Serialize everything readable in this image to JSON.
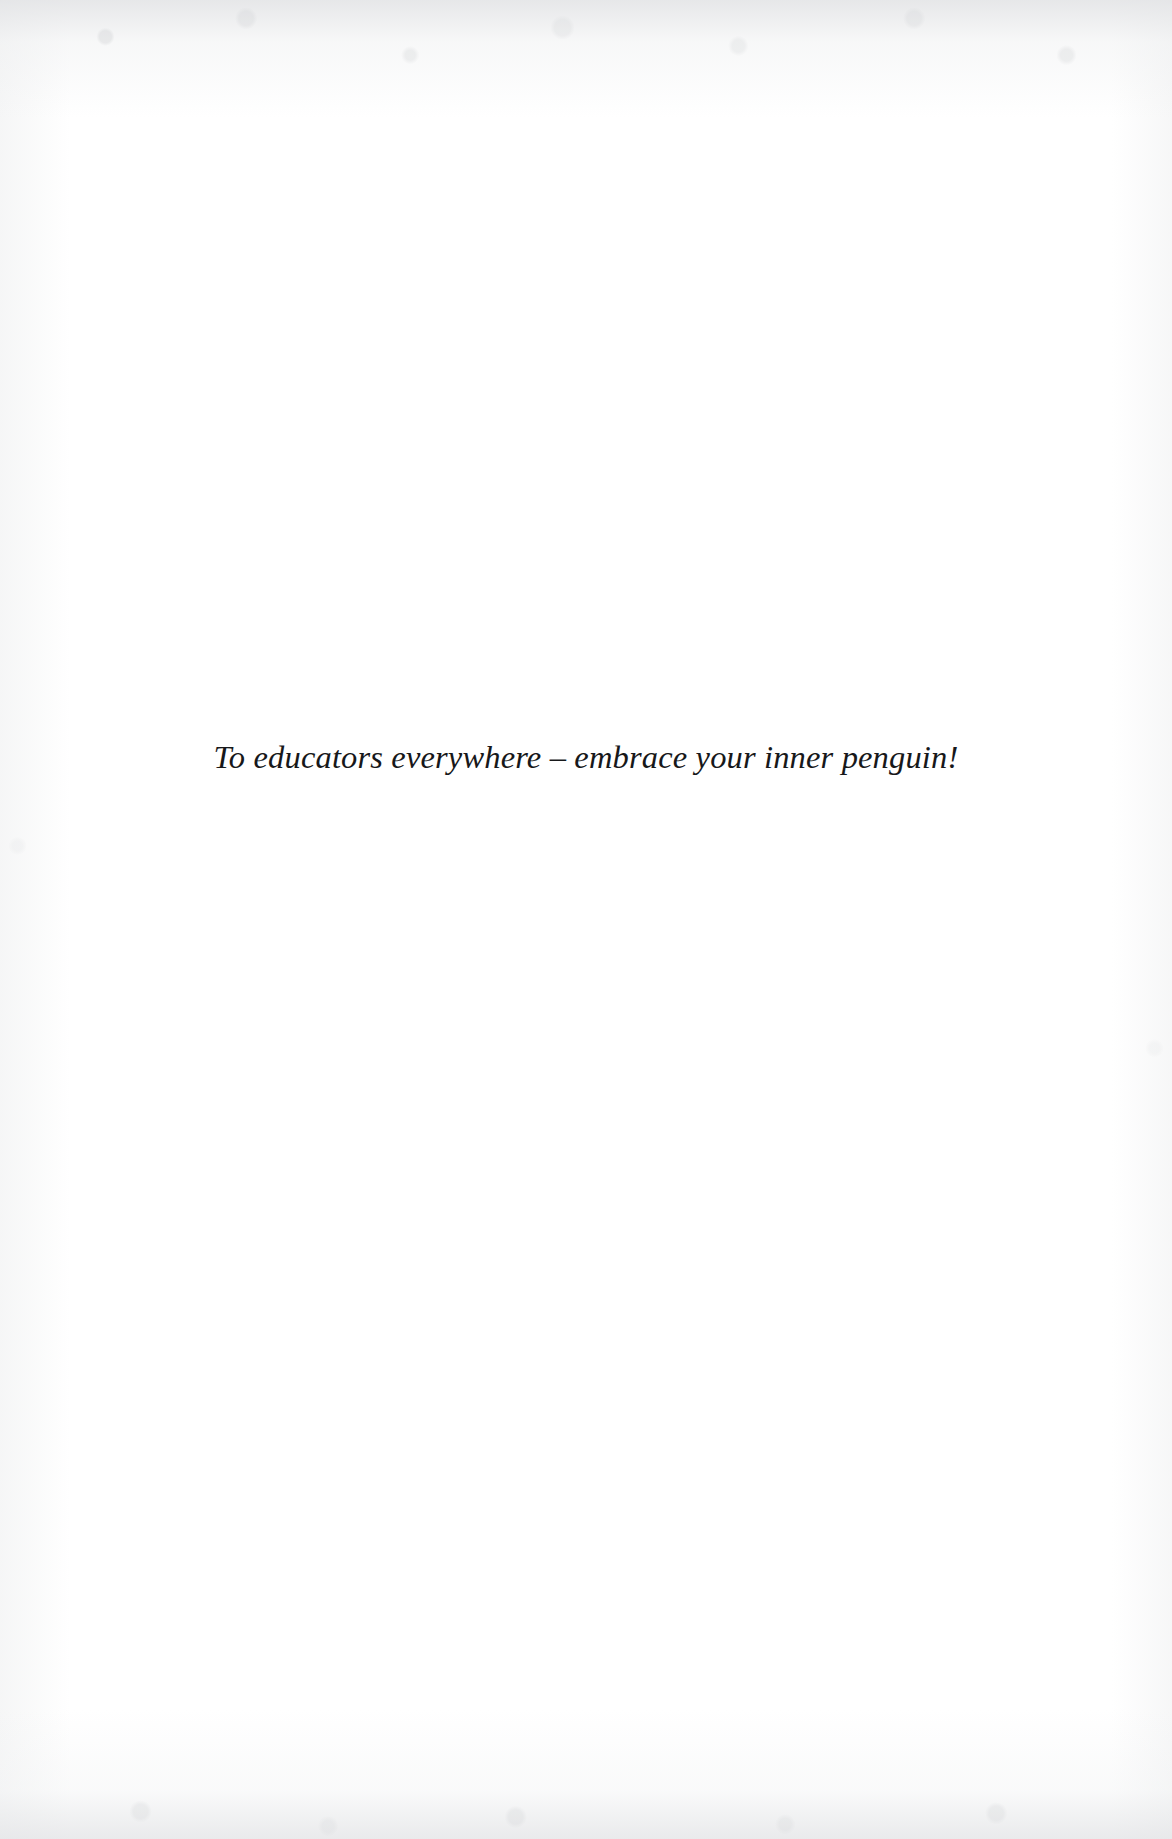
{
  "document": {
    "page_type": "dedication",
    "background_color": "#ffffff",
    "text_color": "#17181a",
    "dedication": {
      "text": "To educators everywhere – embrace your inner penguin!"
    }
  }
}
